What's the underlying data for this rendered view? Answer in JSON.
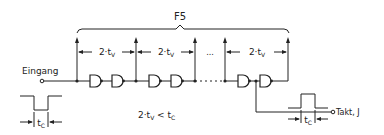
{
  "diagram": {
    "group_label": "F5",
    "input_label": "Eingang",
    "output_label": "Takt, J",
    "segment_delay_label": "2·t",
    "segment_delay_sub": "V",
    "ellipsis": "...",
    "condition": {
      "lhs": "2·t",
      "lhs_sub": "V",
      "op": " < t",
      "rhs_sub": "C"
    },
    "input_pulse_width_label": "t",
    "input_pulse_width_sub": "C",
    "output_pulse_width_label": "t",
    "output_pulse_width_sub": "C",
    "segments": [
      {
        "label": "2·tV"
      },
      {
        "label": "2·tV"
      },
      {
        "label": "..."
      },
      {
        "label": "2·tV"
      }
    ],
    "gate_count_visible": 6,
    "gate_type": "AND (delay element)"
  }
}
